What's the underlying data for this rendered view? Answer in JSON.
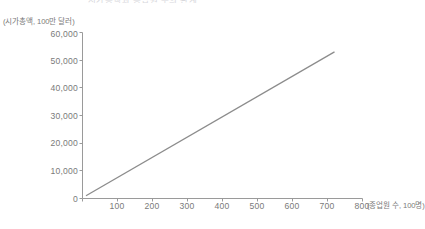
{
  "title_fragment": "시가총액과 종업원 수의 관계",
  "axes": {
    "y_unit_label": "(시가총액, 100만 달러)",
    "x_unit_label": "(종업원 수, 100명)"
  },
  "chart_data": {
    "type": "line",
    "title": "시가총액과 종업원 수의 관계",
    "xlabel": "(종업원 수, 100명)",
    "ylabel": "(시가총액, 100만 달러)",
    "xlim": [
      0,
      800
    ],
    "ylim": [
      0,
      60000
    ],
    "grid": false,
    "legend": false,
    "xticks": [
      0,
      100,
      200,
      300,
      400,
      500,
      600,
      700,
      800
    ],
    "xtick_labels": [
      "0",
      "100",
      "200",
      "300",
      "400",
      "500",
      "600",
      "700",
      "800"
    ],
    "yticks": [
      0,
      10000,
      20000,
      30000,
      40000,
      50000,
      60000
    ],
    "ytick_labels": [
      "0",
      "10,000",
      "20,000",
      "30,000",
      "40,000",
      "50,000",
      "60,000"
    ],
    "line_color": "#8c8c8c",
    "series": [
      {
        "name": "추세선",
        "x": [
          10,
          720
        ],
        "values": [
          1000,
          53000
        ]
      }
    ]
  }
}
